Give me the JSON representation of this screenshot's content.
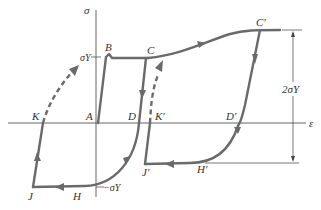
{
  "diagram": {
    "axes": {
      "y_label": "σ",
      "x_label": "ε"
    },
    "level_labels": {
      "yield_positive": "σY",
      "yield_negative": "−σY",
      "span": "2σY"
    },
    "points": {
      "A": "A",
      "B": "B",
      "C": "C",
      "C_prime": "C′",
      "D": "D",
      "D_prime": "D′",
      "H": "H",
      "H_prime": "H′",
      "J": "J",
      "J_prime": "J′",
      "K": "K",
      "K_prime": "K′"
    },
    "colors": {
      "curve": "#6a6a6a",
      "axis": "#555555",
      "text": "#333333"
    }
  }
}
